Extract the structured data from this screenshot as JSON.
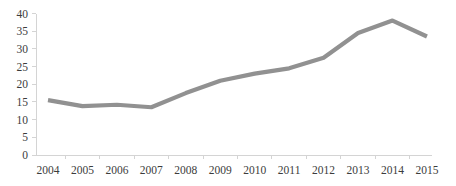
{
  "chart_data": {
    "type": "line",
    "title": "",
    "subtitle": "",
    "xlabel": "",
    "ylabel": "",
    "categories": [
      "2004",
      "2005",
      "2006",
      "2007",
      "2008",
      "2009",
      "2010",
      "2011",
      "2012",
      "2013",
      "2014",
      "2015"
    ],
    "x": [
      2004,
      2005,
      2006,
      2007,
      2008,
      2009,
      2010,
      2011,
      2012,
      2013,
      2014,
      2015
    ],
    "values": [
      15.5,
      13.8,
      14.2,
      13.5,
      17.5,
      21.0,
      23.0,
      24.5,
      27.5,
      34.5,
      38.0,
      33.5
    ],
    "series": [
      {
        "name": "",
        "color": "#919191",
        "values": [
          15.5,
          13.8,
          14.2,
          13.5,
          17.5,
          21.0,
          23.0,
          24.5,
          27.5,
          34.5,
          38.0,
          33.5
        ]
      }
    ],
    "ylim": [
      0,
      40
    ],
    "yticks": [
      0,
      5,
      10,
      15,
      20,
      25,
      30,
      35,
      40
    ],
    "ytick_labels": [
      "0",
      "5",
      "10",
      "15",
      "20",
      "25",
      "30",
      "35",
      "40"
    ],
    "xtick_labels": [
      "2004",
      "2005",
      "2006",
      "2007",
      "2008",
      "2009",
      "2010",
      "2011",
      "2012",
      "2013",
      "2014",
      "2015"
    ],
    "grid": false,
    "legend": false,
    "legend_position": "none",
    "annotations": []
  },
  "style": {
    "line_color": "#919191",
    "line_width": 4.2,
    "axis_color": "#d4d4d4",
    "text_color": "#3c3c3c",
    "background": "#ffffff"
  },
  "geometry": {
    "plot_left": 36,
    "plot_right": 432,
    "plot_top": 13.5,
    "plot_bottom": 155,
    "first_x": 48,
    "x_step": 34.45
  }
}
